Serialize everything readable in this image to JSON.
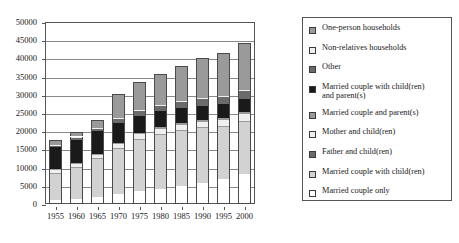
{
  "chart_data": {
    "type": "bar",
    "subtype": "stacked-vertical",
    "title": "",
    "xlabel": "",
    "ylabel": "",
    "categories": [
      "1955",
      "1960",
      "1965",
      "1970",
      "1975",
      "1980",
      "1985",
      "1990",
      "1995",
      "2000"
    ],
    "ylim": [
      0,
      50000
    ],
    "yticks": [
      0,
      5000,
      10000,
      15000,
      20000,
      25000,
      30000,
      35000,
      40000,
      45000,
      50000
    ],
    "ytick_labels": [
      "0",
      "5000",
      "10000",
      "15000",
      "20000",
      "25000",
      "30000",
      "35000",
      "40000",
      "45000",
      "50000"
    ],
    "grid": true,
    "legend_position": "right-outside",
    "stack_order_bottom_to_top": [
      "Married couple only",
      "Married couple with child(ren)",
      "Father and child(ren)",
      "Mother and child(ren)",
      "Married couple and parent(s)",
      "Married couple with child(ren) and parent(s)",
      "Other",
      "Non-relatives households",
      "One-person households"
    ],
    "series": [
      {
        "name": "Married couple only",
        "color": "#ffffff",
        "values": [
          1150,
          1400,
          2050,
          2800,
          3500,
          4200,
          5000,
          5800,
          6800,
          8300
        ]
      },
      {
        "name": "Married couple with child(ren)",
        "color": "#d2d2d2",
        "values": [
          7300,
          8700,
          10300,
          12400,
          14200,
          14900,
          15100,
          15000,
          14500,
          14300
        ]
      },
      {
        "name": "Father and child(ren)",
        "color": "#9a9a9a",
        "values": [
          200,
          200,
          250,
          250,
          250,
          250,
          250,
          250,
          250,
          300
        ]
      },
      {
        "name": "Mother and child(ren)",
        "color": "#efefef",
        "values": [
          800,
          900,
          1000,
          1100,
          1200,
          1300,
          1400,
          1500,
          1650,
          1800
        ]
      },
      {
        "name": "Married couple and parent(s)",
        "color": "#9a9a9a",
        "values": [
          150,
          200,
          250,
          300,
          350,
          400,
          450,
          500,
          550,
          600
        ]
      },
      {
        "name": "Married couple with child(ren) and parent(s)",
        "color": "#1a1a1a",
        "values": [
          6000,
          6300,
          6200,
          5500,
          4800,
          4400,
          4100,
          3900,
          3700,
          3500
        ]
      },
      {
        "name": "Other",
        "color": "#6b6b6b",
        "values": [
          600,
          700,
          800,
          1100,
          1400,
          1700,
          1900,
          2000,
          2100,
          2200
        ]
      },
      {
        "name": "Non-relatives households",
        "color": "#efefef",
        "values": [
          150,
          150,
          150,
          150,
          150,
          150,
          150,
          150,
          150,
          200
        ]
      },
      {
        "name": "One-person households",
        "color": "#9a9a9a",
        "values": [
          1150,
          1350,
          2000,
          6500,
          7650,
          8300,
          9450,
          11000,
          11700,
          12900
        ]
      }
    ],
    "totals": [
      17500,
      19900,
      23000,
      30100,
      33500,
      35600,
      37800,
      40100,
      41400,
      44100
    ]
  },
  "legend": {
    "items": [
      {
        "label": "One-person households",
        "color": "#9a9a9a"
      },
      {
        "label": "Non-relatives households",
        "color": "#efefef"
      },
      {
        "label": "Other",
        "color": "#6b6b6b"
      },
      {
        "label": "Married couple with child(ren)\nand parent(s)",
        "color": "#1a1a1a"
      },
      {
        "label": "Married couple and parent(s)",
        "color": "#9a9a9a"
      },
      {
        "label": "Mother and child(ren)",
        "color": "#efefef"
      },
      {
        "label": "Father and child(ren)",
        "color": "#6b6b6b"
      },
      {
        "label": "Married couple with child(ren)",
        "color": "#d2d2d2"
      },
      {
        "label": "Married couple only",
        "color": "#ffffff"
      }
    ]
  }
}
